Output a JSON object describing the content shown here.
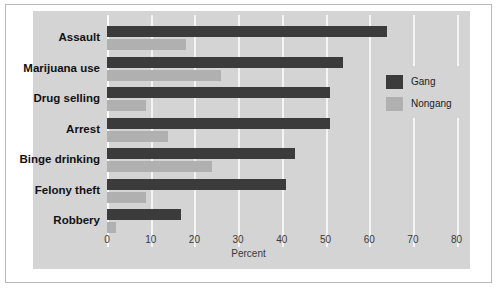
{
  "chart_data": {
    "type": "bar",
    "orientation": "horizontal",
    "title": "",
    "xlabel": "Percent",
    "ylabel": "",
    "xlim": [
      0,
      80
    ],
    "xticks": [
      0,
      10,
      20,
      30,
      40,
      50,
      60,
      70,
      80
    ],
    "xtick_labels": [
      "0",
      "10",
      "20",
      "30",
      "40",
      "50",
      "60",
      "70",
      "80"
    ],
    "grid": true,
    "legend_position": "right-inside",
    "categories": [
      "Assault",
      "Marijuana use",
      "Drug selling",
      "Arrest",
      "Binge drinking",
      "Felony theft",
      "Robbery"
    ],
    "series": [
      {
        "name": "Gang",
        "color": "#3b3b3b",
        "values": [
          64,
          54,
          51,
          51,
          43,
          41,
          17
        ]
      },
      {
        "name": "Nongang",
        "color": "#b0b0b0",
        "values": [
          18,
          26,
          9,
          14,
          24,
          9,
          2
        ]
      }
    ]
  },
  "legend": {
    "items": [
      {
        "label": "Gang",
        "color": "#3b3b3b"
      },
      {
        "label": "Nongang",
        "color": "#b0b0b0"
      }
    ]
  },
  "colors": {
    "page_background": "#ffffff",
    "panel_background": "#d4d4d4",
    "gridline": "#f4f4f4",
    "frame_border": "#b9b9b9",
    "label_text": "#111111",
    "tick_text": "#3a3a3a"
  }
}
